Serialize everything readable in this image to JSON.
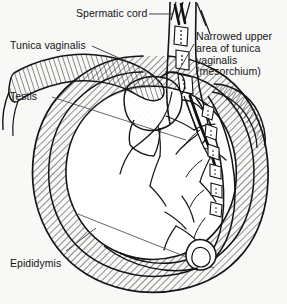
{
  "figure": {
    "background_color": "#f8f8f6",
    "ink_color": "#141414",
    "hatch_color": "#2a2a2a",
    "labels": {
      "spermatic_cord": "Spermatic cord",
      "tunica_vaginalis": "Tunica vaginalis",
      "narrowed_area_line1": "Narrowed upper",
      "narrowed_area_line2": "area of tunica",
      "narrowed_area_line3": "vaginalis",
      "narrowed_area_line4": "(mesorchium)",
      "testis": "Testis",
      "epididymis": "Epididymis"
    },
    "structures": [
      {
        "name": "spermatic-cord",
        "description": "vertical segmented cord at top center-right with vas deferens and vessels"
      },
      {
        "name": "tunica-vaginalis-ring",
        "description": "hatched outer ring enclosing the testis"
      },
      {
        "name": "tunica-vaginalis-flap",
        "description": "hatched reflected flap at upper left"
      },
      {
        "name": "mesorchium",
        "description": "narrowed upper area of tunica vaginalis at right of cord"
      },
      {
        "name": "testis",
        "description": "large oval body with visible vessel branches"
      },
      {
        "name": "epididymis",
        "description": "coiled segmented duct running along right margin of testis"
      },
      {
        "name": "epididymis-head",
        "description": "globus major lobed mass at upper pole of testis"
      },
      {
        "name": "epididymis-tail",
        "description": "globus minor coil at lower pole of testis"
      }
    ]
  }
}
